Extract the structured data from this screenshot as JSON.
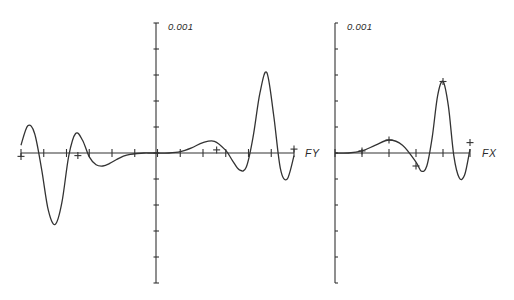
{
  "chart_data": [
    {
      "type": "line",
      "title": "",
      "xlabel": "FY",
      "ylabel": "",
      "y_scale_label": "0.001",
      "y_tick_unit": 0.001,
      "ylim": [
        -5,
        5
      ],
      "xlim": [
        -6,
        6
      ],
      "grid": false,
      "x_ticks": [
        -6,
        -5,
        -4,
        -3,
        -2,
        -1,
        0,
        1,
        2,
        3,
        4,
        5,
        6
      ],
      "y_ticks": [
        -5,
        -4,
        -3,
        -2,
        -1,
        0,
        1,
        2,
        3,
        4,
        5
      ],
      "series": [
        {
          "name": "FY response",
          "x": [
            -6.0,
            -5.7,
            -5.4,
            -5.1,
            -4.8,
            -4.5,
            -4.2,
            -3.9,
            -3.6,
            -3.3,
            -3.0,
            -2.7,
            -2.4,
            -2.1,
            -1.8,
            -1.5,
            -1.2,
            -0.9,
            -0.6,
            -0.3,
            0.0,
            0.5,
            1.0,
            1.5,
            2.0,
            2.5,
            3.0,
            3.3,
            3.6,
            3.9,
            4.2,
            4.5,
            4.8,
            5.1,
            5.4,
            5.7,
            6.0
          ],
          "y": [
            0.3,
            1.05,
            0.75,
            -0.6,
            -2.2,
            -2.75,
            -1.9,
            -0.1,
            0.75,
            0.5,
            -0.15,
            -0.45,
            -0.5,
            -0.4,
            -0.25,
            -0.12,
            -0.05,
            -0.02,
            0.0,
            0.0,
            0.0,
            0.0,
            0.05,
            0.2,
            0.4,
            0.45,
            0.1,
            -0.3,
            -0.65,
            -0.55,
            0.6,
            2.3,
            3.1,
            1.5,
            -0.6,
            -1.0,
            -0.1
          ]
        }
      ],
      "markers": [
        {
          "x": -6.0,
          "y": -0.13
        },
        {
          "x": -3.5,
          "y": -0.1
        },
        {
          "x": 2.6,
          "y": 0.12
        },
        {
          "x": 6.0,
          "y": 0.15
        }
      ]
    },
    {
      "type": "line",
      "title": "",
      "xlabel": "FX",
      "ylabel": "",
      "y_scale_label": "0.001",
      "y_tick_unit": 0.001,
      "ylim": [
        -5,
        5
      ],
      "xlim": [
        0,
        5
      ],
      "grid": false,
      "x_ticks": [
        0,
        1,
        2,
        3,
        4,
        5
      ],
      "y_ticks": [
        -5,
        -4,
        -3,
        -2,
        -1,
        0,
        1,
        2,
        3,
        4,
        5
      ],
      "series": [
        {
          "name": "FX response",
          "x": [
            0.0,
            0.5,
            1.0,
            1.5,
            2.0,
            2.5,
            3.0,
            3.2,
            3.4,
            3.6,
            3.8,
            4.0,
            4.2,
            4.4,
            4.6,
            4.8,
            5.0
          ],
          "y": [
            0.0,
            0.0,
            0.08,
            0.3,
            0.5,
            0.3,
            -0.35,
            -0.7,
            -0.5,
            0.6,
            2.2,
            2.75,
            1.8,
            -0.1,
            -0.95,
            -0.85,
            0.15
          ],
          "_note": ""
        }
      ],
      "markers": [
        {
          "x": 1.0,
          "y": 0.08
        },
        {
          "x": 2.0,
          "y": 0.5
        },
        {
          "x": 3.0,
          "y": -0.5
        },
        {
          "x": 4.0,
          "y": 2.75
        },
        {
          "x": 5.0,
          "y": 0.4
        }
      ]
    }
  ],
  "labels": {
    "left_scale": "0.001",
    "left_axis": "FY",
    "right_scale": "0.001",
    "right_axis": "FX"
  }
}
